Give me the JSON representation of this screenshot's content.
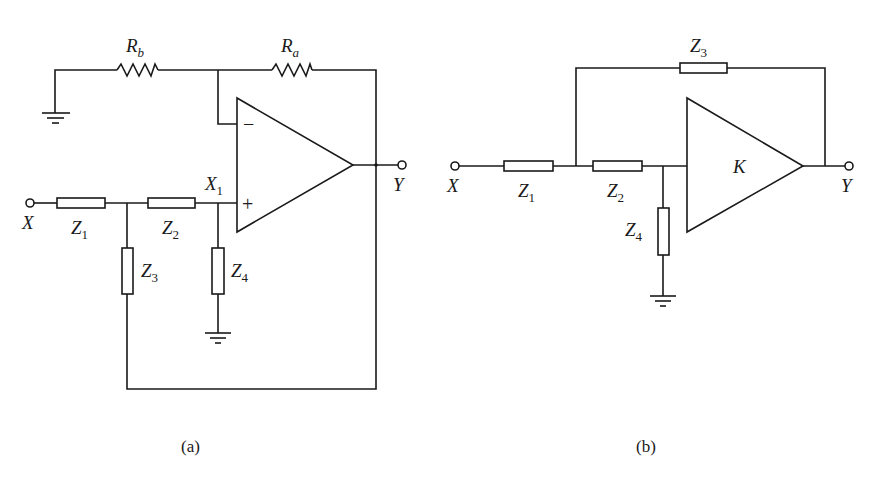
{
  "figure": {
    "type": "circuit-schematic",
    "panels": [
      {
        "id": "a",
        "caption": "(a)",
        "input_label": "X",
        "output_label": "Y",
        "node_label": {
          "base": "X",
          "sub": "1"
        },
        "opamp": {
          "minus": "−",
          "plus": "+"
        },
        "components": {
          "rb": {
            "base": "R",
            "sub": "b",
            "kind": "resistor"
          },
          "ra": {
            "base": "R",
            "sub": "a",
            "kind": "resistor"
          },
          "z1": {
            "base": "Z",
            "sub": "1",
            "kind": "impedance"
          },
          "z2": {
            "base": "Z",
            "sub": "2",
            "kind": "impedance"
          },
          "z3": {
            "base": "Z",
            "sub": "3",
            "kind": "impedance"
          },
          "z4": {
            "base": "Z",
            "sub": "4",
            "kind": "impedance"
          }
        }
      },
      {
        "id": "b",
        "caption": "(b)",
        "input_label": "X",
        "output_label": "Y",
        "amplifier_gain": "K",
        "components": {
          "z1": {
            "base": "Z",
            "sub": "1",
            "kind": "impedance"
          },
          "z2": {
            "base": "Z",
            "sub": "2",
            "kind": "impedance"
          },
          "z3": {
            "base": "Z",
            "sub": "3",
            "kind": "impedance"
          },
          "z4": {
            "base": "Z",
            "sub": "4",
            "kind": "impedance"
          }
        }
      }
    ]
  }
}
